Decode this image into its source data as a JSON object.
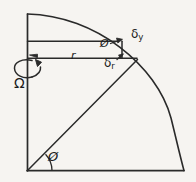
{
  "figure": {
    "type": "hand-drawn-geometry-diagram",
    "background_color": "#f6f4f1",
    "ink_color": "#1b1b1b",
    "labels": {
      "phi_bottom": "Ø",
      "phi_top": "Ø",
      "radius": "r",
      "omega": "Ω",
      "delta_y": "δ",
      "delta_y_sub": "y",
      "delta_r": "δ",
      "delta_r_sub": "r"
    },
    "geometry": {
      "origin_x": 27,
      "origin_y": 171,
      "arc_top_x": 27,
      "arc_top_y": 14,
      "arc_right_x": 184,
      "arc_right_y": 171,
      "radius_px": 157,
      "upper_chord_y": 41,
      "lower_chord_y": 58,
      "upper_chord_end_x": 118,
      "lower_chord_end_x": 137,
      "delta_y_segment_x": 122,
      "radial_end_x": 137,
      "radial_end_y": 60,
      "phi_angle_degrees": 35
    }
  }
}
